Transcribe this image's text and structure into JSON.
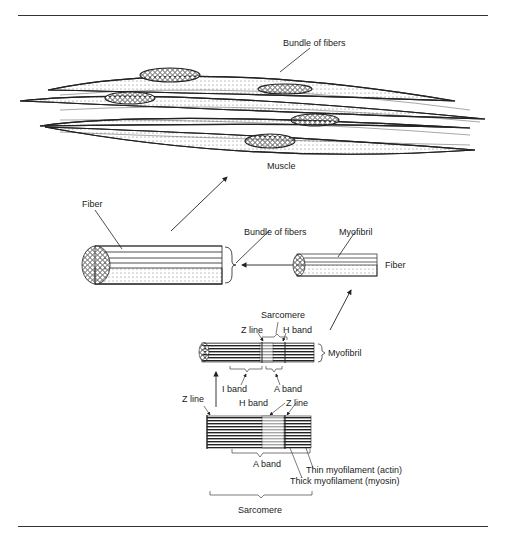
{
  "figure": {
    "type": "anatomical-diagram"
  },
  "labels": {
    "muscle_bundle": "Bundle of fibers",
    "muscle": "Muscle",
    "fiber_left": "Fiber",
    "bundle_of_fibers": "Bundle of fibers",
    "myofibril_top": "Myofibril",
    "fiber_right": "Fiber",
    "sarcomere_top": "Sarcomere",
    "z_line_top": "Z line",
    "h_band_top": "H band",
    "myofibril_side": "Myofibril",
    "i_band": "I band",
    "a_band_top": "A band",
    "z_line_left": "Z line",
    "h_band_bottom": "H band",
    "z_line_right": "Z line",
    "a_band_bottom": "A band",
    "thin_myofilament": "Thin myofilament (actin)",
    "thick_myofilament": "Thick myofilament (myosin)",
    "sarcomere_bottom": "Sarcomere"
  },
  "colors": {
    "ink": "#222222",
    "background": "#ffffff"
  }
}
